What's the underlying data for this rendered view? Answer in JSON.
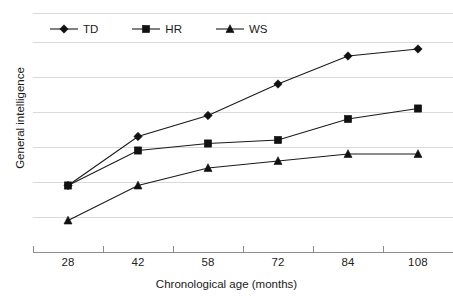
{
  "chart_data": {
    "type": "line",
    "title": "",
    "xlabel": "Chronological age (months)",
    "ylabel": "General intelligence",
    "categories": [
      "28",
      "42",
      "58",
      "72",
      "84",
      "108"
    ],
    "series": [
      {
        "name": "TD",
        "marker": "diamond",
        "values": [
          1.9,
          3.3,
          3.9,
          4.8,
          5.6,
          5.8
        ]
      },
      {
        "name": "HR",
        "marker": "square",
        "values": [
          1.9,
          2.9,
          3.1,
          3.2,
          3.8,
          4.1
        ]
      },
      {
        "name": "WS",
        "marker": "triangle",
        "values": [
          0.9,
          1.9,
          2.4,
          2.6,
          2.8,
          2.8
        ]
      }
    ],
    "ylim": [
      0,
      7
    ],
    "y_gridline_values": [
      0,
      1,
      2,
      3,
      4,
      5,
      6,
      6.83
    ],
    "y_tick_labels": [],
    "grid": true,
    "legend_position": "top-left",
    "line_color": "#1a1a1a",
    "grid_color": "#d9d9d9",
    "axis_color": "#8c8c8c",
    "background": "#ffffff"
  },
  "legend": {
    "entries": [
      {
        "label": "TD",
        "marker": "diamond-marker-icon"
      },
      {
        "label": "HR",
        "marker": "square-marker-icon"
      },
      {
        "label": "WS",
        "marker": "triangle-marker-icon"
      }
    ]
  },
  "axes": {
    "x_title": "Chronological age (months)",
    "y_title": "General intelligence",
    "x_tick_labels": [
      "28",
      "42",
      "58",
      "72",
      "84",
      "108"
    ]
  }
}
